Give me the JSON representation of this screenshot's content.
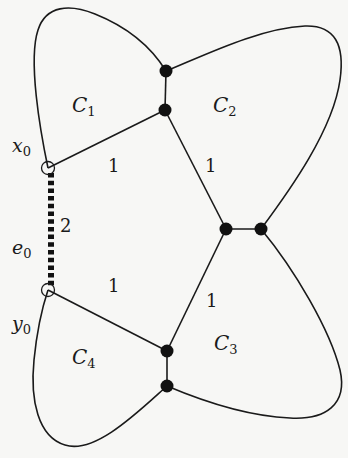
{
  "diagram": {
    "type": "graph",
    "vertices": [
      {
        "id": "x0",
        "label": "x",
        "sub": "0",
        "x": 48,
        "y": 168,
        "style": "open"
      },
      {
        "id": "y0",
        "label": "y",
        "sub": "0",
        "x": 48,
        "y": 290,
        "style": "open"
      },
      {
        "id": "a",
        "x": 166,
        "y": 71,
        "style": "filled"
      },
      {
        "id": "b",
        "x": 165,
        "y": 110,
        "style": "filled"
      },
      {
        "id": "d",
        "x": 226,
        "y": 229,
        "style": "filled"
      },
      {
        "id": "e",
        "x": 261,
        "y": 229,
        "style": "filled"
      },
      {
        "id": "f",
        "x": 167,
        "y": 351,
        "style": "filled"
      },
      {
        "id": "g",
        "x": 167,
        "y": 386,
        "style": "filled"
      }
    ],
    "edges": [
      {
        "from": "x0",
        "to": "y0",
        "style": "dashed-thick",
        "label": "e",
        "label_sub": "0",
        "weight": "2"
      },
      {
        "from": "x0",
        "to": "b",
        "weight": "1"
      },
      {
        "from": "b",
        "to": "d",
        "weight": "1"
      },
      {
        "from": "y0",
        "to": "f",
        "weight": "1"
      },
      {
        "from": "f",
        "to": "d",
        "weight": "1"
      },
      {
        "from": "a",
        "to": "b"
      },
      {
        "from": "d",
        "to": "e"
      },
      {
        "from": "f",
        "to": "g"
      }
    ],
    "cycles": [
      {
        "label": "C",
        "sub": "1"
      },
      {
        "label": "C",
        "sub": "2"
      },
      {
        "label": "C",
        "sub": "3"
      },
      {
        "label": "C",
        "sub": "4"
      }
    ],
    "weights": {
      "x0_b": "1",
      "b_d": "1",
      "e0": "2",
      "y0_f": "1",
      "f_d": "1"
    }
  }
}
